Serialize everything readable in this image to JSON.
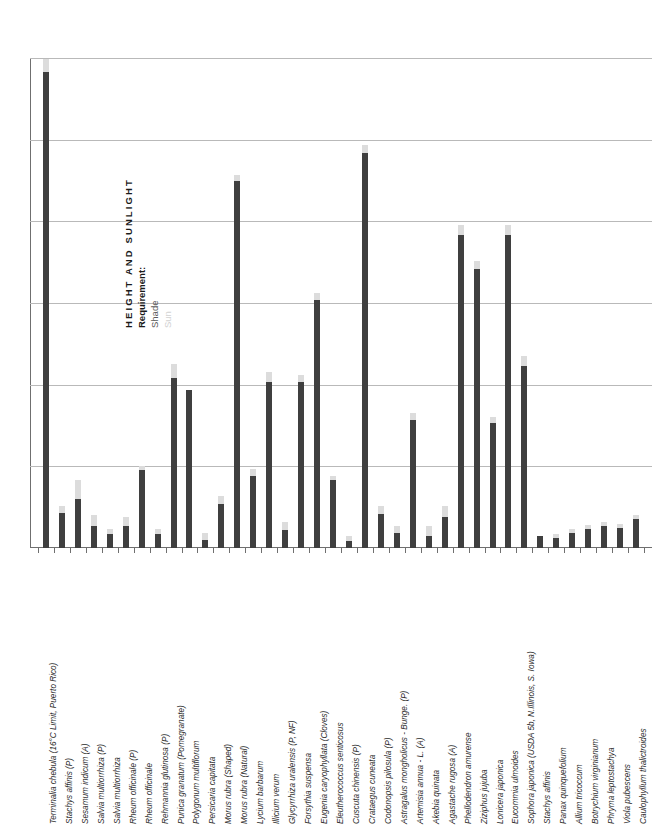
{
  "legend": {
    "title": "HEIGHT AND SUNLIGHT",
    "subtitle": "Requirement:",
    "items": [
      {
        "label": "Shade",
        "color": "#3f3f3f"
      },
      {
        "label": "Sun",
        "color": "#dcdcdc"
      }
    ]
  },
  "chart_data": {
    "type": "bar",
    "title": "HEIGHT AND SUNLIGHT",
    "xlabel": "",
    "ylabel": "",
    "ylim": [
      0,
      36
    ],
    "grid": true,
    "gridlines": [
      6,
      12,
      18,
      24,
      30,
      36
    ],
    "legend_position": "inside-left",
    "stacked": true,
    "categories": [
      "Terminalia chebula  (16°C Limit, Puerto Rico)",
      "Stachys affinis (P)",
      "Sesamum indicum (A)",
      "Salvia multiorrhiza (P)",
      "Salvia multiorrhiza",
      "Rheum officinale (P)",
      "Rheum officinale",
      "Rehmannia glutinosa (P)",
      "Punica granatum (Pomegranate)",
      "Polygonum multiflorum",
      "Persicaria capitata",
      "Morus rubra (Shaped)",
      "Morus rubra (Natural)",
      "Lycium barbarum",
      "Illicium verum",
      "Glycyrrhiza uralensis (P, NF)",
      "Forsythia suspensa",
      "Eugenia caryophyllata (Cloves)",
      "Eleutherococcus senticosus",
      "Cuscuta chinensis (P)",
      "Crataegus cuneata",
      "Codonopsis pilosula (P)",
      "Astragalus mongholicus - Bunge. (P)",
      "Artemisia annua - L. (A)",
      "Akebia quinata",
      "Agastache rugosa (A)",
      "Phellodendron amurense",
      "Ziziphus jujuba",
      "Lonicera japonica",
      "Eucommia ulmoides",
      "Sophora japonica (USDA 5b, N.Illinois, S. Iowa)",
      "Stachys affinis",
      "Panax quinquefolium",
      "Allium tricoccum",
      "Botrychium virginianum",
      "Phryma leptostachya",
      "Viola pubescens",
      "Caulophyllum thalictroides"
    ],
    "series": [
      {
        "name": "Shade",
        "color": "#3f3f3f",
        "values": [
          35.0,
          2.6,
          3.6,
          1.6,
          1.0,
          1.6,
          5.7,
          1.0,
          12.5,
          11.6,
          0.6,
          3.2,
          27.0,
          5.3,
          12.2,
          1.3,
          12.2,
          18.2,
          5.0,
          0.5,
          29.0,
          2.5,
          1.1,
          9.4,
          0.9,
          2.3,
          23.0,
          20.5,
          9.2,
          23.0,
          13.4,
          0.9,
          0.7,
          1.1,
          1.4,
          1.6,
          1.5,
          2.1
        ]
      },
      {
        "name": "Sun",
        "color": "#dcdcdc",
        "values": [
          0.9,
          0.5,
          1.4,
          0.8,
          0.4,
          0.7,
          0.3,
          0.4,
          1.0,
          0.0,
          0.5,
          0.6,
          0.4,
          0.5,
          0.7,
          0.6,
          0.5,
          0.5,
          0.3,
          0.4,
          0.6,
          0.6,
          0.5,
          0.5,
          0.7,
          0.8,
          0.7,
          0.6,
          0.4,
          0.7,
          0.7,
          0.0,
          0.3,
          0.3,
          0.3,
          0.3,
          0.3,
          0.3
        ]
      }
    ]
  }
}
